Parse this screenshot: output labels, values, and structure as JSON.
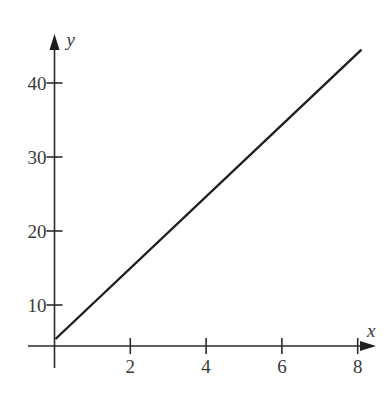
{
  "chart_data": {
    "type": "line",
    "title": "",
    "xlabel": "x",
    "ylabel": "y",
    "x_ticks": [
      2,
      4,
      6,
      8
    ],
    "x_tick_labels": [
      "2",
      "4",
      "6",
      "8"
    ],
    "y_ticks": [
      10,
      20,
      30,
      40
    ],
    "y_tick_labels": [
      "10",
      "20",
      "30",
      "40"
    ],
    "xlim": [
      0,
      8.6
    ],
    "ylim": [
      0,
      46
    ],
    "grid": false,
    "legend": null,
    "series": [
      {
        "name": "line",
        "x": [
          0,
          8.1
        ],
        "y": [
          5,
          44.5
        ]
      }
    ]
  },
  "layout": {
    "origin_px": [
      54.5,
      346
    ],
    "x_px_per_unit": 37.9,
    "y_ref_value": 40,
    "y_ref_px": 83,
    "y_px_per_unit": 7.4,
    "x_axis_start_px": 28,
    "x_axis_end_px": 376,
    "y_axis_top_px": 34,
    "y_axis_bottom_px": 368
  }
}
